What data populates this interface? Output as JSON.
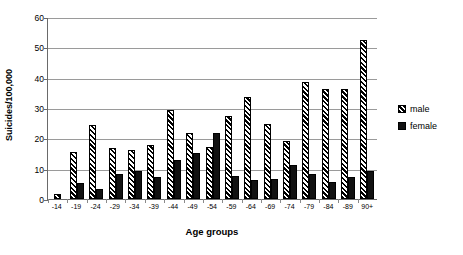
{
  "chart_data": {
    "type": "bar",
    "title": "",
    "xlabel": "Age groups",
    "ylabel": "Suicides/100,000",
    "ylim": [
      0,
      60
    ],
    "yticks": [
      0,
      10,
      20,
      30,
      40,
      50,
      60
    ],
    "grid": true,
    "legend_position": "right",
    "categories": [
      "-14",
      "-19",
      "-24",
      "-29",
      "-34",
      "-39",
      "-44",
      "-49",
      "-54",
      "-59",
      "-64",
      "-69",
      "-74",
      "-79",
      "-84",
      "-89",
      "90+"
    ],
    "series": [
      {
        "name": "male",
        "values": [
          1.8,
          15.5,
          24.5,
          16.8,
          16.3,
          17.8,
          29.2,
          21.7,
          17.3,
          27.5,
          33.6,
          24.7,
          19.2,
          38.6,
          36.2,
          36.4,
          52.5
        ]
      },
      {
        "name": "female",
        "values": [
          0,
          5.3,
          3.3,
          8.2,
          9.4,
          7.2,
          13.0,
          15.1,
          21.7,
          7.6,
          6.4,
          6.5,
          11.3,
          8.3,
          5.6,
          7.3,
          9.2
        ]
      }
    ]
  },
  "legend": {
    "items": [
      {
        "label": "male",
        "swatch": "hatched-swatch"
      },
      {
        "label": "female",
        "swatch": "solid-black-swatch"
      }
    ]
  },
  "colors": {
    "axis": "#6a6a6a",
    "grid": "#9a9a9a",
    "female_fill": "#111111",
    "male_fill": "#ffffff",
    "text": "#000000"
  }
}
